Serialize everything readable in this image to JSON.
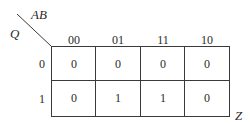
{
  "kmap": {
    "column_variables": "AB",
    "row_variable": "Q",
    "output_label": "Z",
    "columns": [
      "00",
      "01",
      "11",
      "10"
    ],
    "rows": [
      {
        "label": "0",
        "cells": [
          "0",
          "0",
          "0",
          "0"
        ]
      },
      {
        "label": "1",
        "cells": [
          "0",
          "1",
          "1",
          "0"
        ]
      }
    ]
  }
}
